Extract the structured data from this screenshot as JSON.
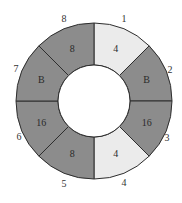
{
  "diagram": {
    "type": "ring-segments",
    "center": [
      94,
      101
    ],
    "outer_radius": 78,
    "inner_radius": 36,
    "colors": {
      "light": "#ebebeb",
      "dark": "#8c8c8c",
      "stroke": "#2e2e2e",
      "hole": "#ffffff"
    },
    "segments": [
      {
        "index": 1,
        "value": "4",
        "shade": "light"
      },
      {
        "index": 2,
        "value": "B",
        "shade": "dark"
      },
      {
        "index": 3,
        "value": "16",
        "shade": "dark"
      },
      {
        "index": 4,
        "value": "4",
        "shade": "light"
      },
      {
        "index": 5,
        "value": "8",
        "shade": "dark"
      },
      {
        "index": 6,
        "value": "16",
        "shade": "dark"
      },
      {
        "index": 7,
        "value": "B",
        "shade": "dark"
      },
      {
        "index": 8,
        "value": "8",
        "shade": "dark"
      }
    ],
    "outer_labels": [
      {
        "text": "1",
        "x": 124,
        "y": 22
      },
      {
        "text": "2",
        "x": 170,
        "y": 73
      },
      {
        "text": "3",
        "x": 167,
        "y": 141
      },
      {
        "text": "4",
        "x": 124,
        "y": 186
      },
      {
        "text": "5",
        "x": 64,
        "y": 187
      },
      {
        "text": "6",
        "x": 19,
        "y": 140
      },
      {
        "text": "7",
        "x": 16,
        "y": 72
      },
      {
        "text": "8",
        "x": 64,
        "y": 22
      }
    ]
  }
}
